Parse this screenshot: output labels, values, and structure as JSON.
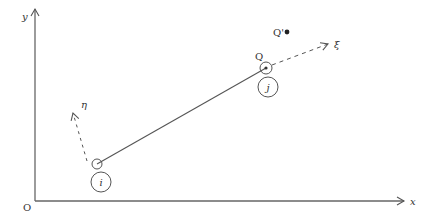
{
  "diagram": {
    "axes": {
      "x_label": "x",
      "y_label": "y",
      "origin_label": "O"
    },
    "nodes": {
      "node_i": {
        "label": "i"
      },
      "node_j": {
        "label": "j"
      }
    },
    "points": {
      "Q": {
        "label": "Q"
      },
      "Q_prime": {
        "label": "Q'"
      }
    },
    "local_axes": {
      "xi": {
        "label": "ξ"
      },
      "eta": {
        "label": "η"
      }
    },
    "colors": {
      "line": "#555555",
      "text": "#333333"
    }
  }
}
